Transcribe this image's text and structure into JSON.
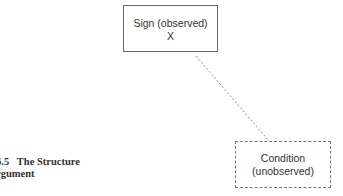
{
  "diagram": {
    "nodes": [
      {
        "id": "sign",
        "label": "Sign (observed)",
        "sublabel": "X",
        "border": "solid"
      },
      {
        "id": "condition",
        "label": "Condition",
        "sublabel": "(unobserved)",
        "border": "dashed"
      }
    ],
    "edges": [
      {
        "from": "sign",
        "to": "condition",
        "style": "dotted",
        "arrow": "end"
      }
    ]
  },
  "heading": {
    "line1": "6.5   The Structure",
    "line2": "rgument"
  },
  "colors": {
    "box_border": "#666666",
    "arrow": "#777777",
    "text": "#333333"
  }
}
